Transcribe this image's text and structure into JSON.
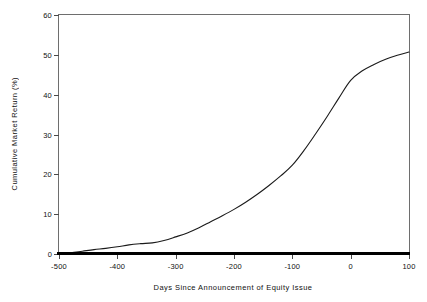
{
  "chart_data": {
    "type": "line",
    "title": "",
    "xlabel": "Days Since Announcement of Equity Issue",
    "ylabel": "Cumulative Market Return (%)",
    "xlim": [
      -500,
      100
    ],
    "ylim": [
      0,
      60
    ],
    "xticks": [
      -500,
      -400,
      -300,
      -200,
      -100,
      0,
      100
    ],
    "xtick_labels": [
      "-500",
      "-400",
      "-300",
      "-200",
      "-100",
      "0",
      "100"
    ],
    "yticks": [
      0,
      10,
      20,
      30,
      40,
      50,
      60
    ],
    "ytick_labels": [
      "0",
      "10",
      "20",
      "30",
      "40",
      "50",
      "60"
    ],
    "grid": false,
    "legend": false,
    "line_color": "#1a1a1a",
    "axis_color": "#6e6e6e",
    "baseline_color": "#000000",
    "series": [
      {
        "name": "Cumulative Market Return",
        "x": [
          -500,
          -480,
          -460,
          -440,
          -420,
          -400,
          -380,
          -360,
          -340,
          -320,
          -300,
          -280,
          -260,
          -240,
          -220,
          -200,
          -180,
          -160,
          -140,
          -120,
          -100,
          -80,
          -60,
          -40,
          -20,
          0,
          20,
          40,
          60,
          80,
          100
        ],
        "values": [
          0.0,
          0.3,
          0.7,
          1.1,
          1.4,
          1.8,
          2.3,
          2.6,
          2.8,
          3.4,
          4.3,
          5.3,
          6.6,
          8.1,
          9.6,
          11.2,
          13.0,
          15.0,
          17.2,
          19.6,
          22.3,
          26.0,
          30.2,
          34.6,
          39.2,
          43.6,
          46.0,
          47.6,
          48.9,
          49.9,
          50.7
        ]
      }
    ]
  }
}
